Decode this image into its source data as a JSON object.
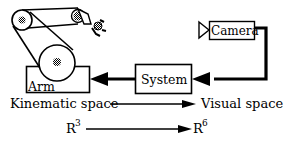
{
  "diagram": {
    "blocks": {
      "arm": {
        "label": "Arm"
      },
      "system": {
        "label": "System"
      },
      "camera": {
        "label": "Camera"
      }
    },
    "mapping_row_1": {
      "from": "Kinematic space",
      "to": "Visual space"
    },
    "mapping_row_2": {
      "from_base": "R",
      "from_exp": "3",
      "to_base": "R",
      "to_exp": "6"
    },
    "edges": [
      {
        "from": "camera",
        "to": "system",
        "style": "thick"
      },
      {
        "from": "system",
        "to": "arm",
        "style": "thick"
      },
      {
        "from": "Kinematic space",
        "to": "Visual space",
        "style": "thin"
      },
      {
        "from": "R3",
        "to": "R6",
        "style": "thin"
      }
    ],
    "colors": {
      "ink": "#000000",
      "background": "#ffffff",
      "joint_fill": "#555555"
    }
  }
}
